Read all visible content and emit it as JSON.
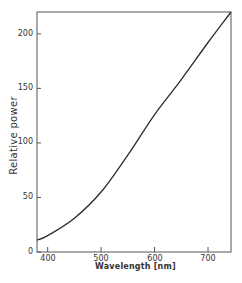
{
  "chart_data": {
    "type": "line",
    "title": "",
    "xlabel": "Wavelength [nm]",
    "ylabel": "Relative power",
    "xlim": [
      380,
      743
    ],
    "ylim": [
      0,
      220
    ],
    "grid": false,
    "legend": null,
    "x_ticks": [
      400,
      500,
      600,
      700
    ],
    "y_ticks": [
      0,
      50,
      100,
      150,
      200
    ],
    "series": [
      {
        "name": "Relative power",
        "x": [
          380,
          400,
          450,
          500,
          550,
          600,
          650,
          700,
          743
        ],
        "values": [
          11,
          15,
          31,
          55,
          89,
          126,
          158,
          192,
          220
        ]
      }
    ]
  },
  "labels": {
    "xlabel": "Wavelength [nm]",
    "ylabel": "Relative power",
    "y_ticks": [
      "0",
      "50",
      "100",
      "150",
      "200"
    ],
    "x_ticks": [
      "400",
      "500",
      "600",
      "700"
    ]
  },
  "colors": {
    "line": "#2a2a2a",
    "axis": "#555555",
    "background": "#ffffff"
  }
}
